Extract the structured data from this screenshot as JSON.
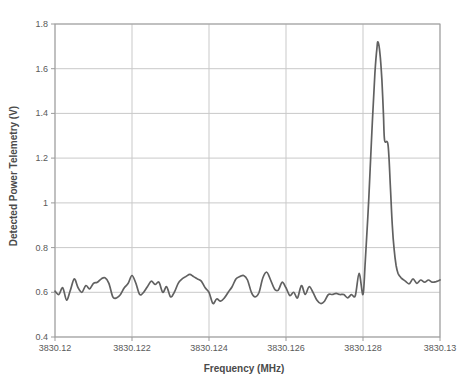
{
  "chart_data": {
    "type": "line",
    "title": "",
    "xlabel": "Frequency (MHz)",
    "ylabel": "Detected Power Telemetry (V)",
    "xlim": [
      3830.12,
      3830.13
    ],
    "ylim": [
      0.4,
      1.8
    ],
    "x_tick_labels": [
      "3830.12",
      "3830.122",
      "3830.124",
      "3830.126",
      "3830.128",
      "3830.13"
    ],
    "x_tick_values": [
      3830.12,
      3830.122,
      3830.124,
      3830.126,
      3830.128,
      3830.13
    ],
    "y_tick_labels": [
      "0.4",
      "0.6",
      "0.8",
      "1",
      "1.2",
      "1.4",
      "1.6",
      "1.8"
    ],
    "y_tick_values": [
      0.4,
      0.6,
      0.8,
      1,
      1.2,
      1.4,
      1.6,
      1.8
    ],
    "grid": true,
    "legend_position": "none",
    "colors": {
      "line": "#616161",
      "grid": "#c9c9c9",
      "axis_border": "#9b9b9b",
      "tick_text": "#595959"
    },
    "series": [
      {
        "name": "Detected Power Telemetry",
        "points": [
          [
            3830.12,
            0.605
          ],
          [
            3830.1201,
            0.59
          ],
          [
            3830.1202,
            0.62
          ],
          [
            3830.1203,
            0.565
          ],
          [
            3830.1204,
            0.61
          ],
          [
            3830.1205,
            0.66
          ],
          [
            3830.1206,
            0.62
          ],
          [
            3830.1207,
            0.6
          ],
          [
            3830.1208,
            0.63
          ],
          [
            3830.1209,
            0.615
          ],
          [
            3830.121,
            0.64
          ],
          [
            3830.1211,
            0.645
          ],
          [
            3830.1212,
            0.66
          ],
          [
            3830.1213,
            0.665
          ],
          [
            3830.1214,
            0.64
          ],
          [
            3830.1215,
            0.58
          ],
          [
            3830.1216,
            0.575
          ],
          [
            3830.1217,
            0.59
          ],
          [
            3830.1218,
            0.62
          ],
          [
            3830.1219,
            0.64
          ],
          [
            3830.122,
            0.675
          ],
          [
            3830.1221,
            0.64
          ],
          [
            3830.1222,
            0.59
          ],
          [
            3830.1223,
            0.6
          ],
          [
            3830.1224,
            0.625
          ],
          [
            3830.1225,
            0.65
          ],
          [
            3830.1226,
            0.635
          ],
          [
            3830.1227,
            0.645
          ],
          [
            3830.1228,
            0.6
          ],
          [
            3830.1229,
            0.625
          ],
          [
            3830.123,
            0.58
          ],
          [
            3830.1231,
            0.6
          ],
          [
            3830.1232,
            0.64
          ],
          [
            3830.1233,
            0.66
          ],
          [
            3830.1234,
            0.67
          ],
          [
            3830.1235,
            0.68
          ],
          [
            3830.1236,
            0.67
          ],
          [
            3830.1237,
            0.66
          ],
          [
            3830.1238,
            0.65
          ],
          [
            3830.1239,
            0.62
          ],
          [
            3830.124,
            0.6
          ],
          [
            3830.1241,
            0.55
          ],
          [
            3830.1242,
            0.57
          ],
          [
            3830.1243,
            0.56
          ],
          [
            3830.1244,
            0.575
          ],
          [
            3830.1245,
            0.6
          ],
          [
            3830.1246,
            0.625
          ],
          [
            3830.1247,
            0.66
          ],
          [
            3830.1248,
            0.67
          ],
          [
            3830.1249,
            0.675
          ],
          [
            3830.125,
            0.655
          ],
          [
            3830.1251,
            0.6
          ],
          [
            3830.1252,
            0.58
          ],
          [
            3830.1253,
            0.6
          ],
          [
            3830.1254,
            0.665
          ],
          [
            3830.1255,
            0.69
          ],
          [
            3830.1256,
            0.655
          ],
          [
            3830.1257,
            0.615
          ],
          [
            3830.1258,
            0.61
          ],
          [
            3830.1259,
            0.645
          ],
          [
            3830.126,
            0.62
          ],
          [
            3830.1261,
            0.585
          ],
          [
            3830.1262,
            0.6
          ],
          [
            3830.1263,
            0.575
          ],
          [
            3830.1264,
            0.63
          ],
          [
            3830.1265,
            0.59
          ],
          [
            3830.1266,
            0.625
          ],
          [
            3830.1267,
            0.6
          ],
          [
            3830.1268,
            0.565
          ],
          [
            3830.1269,
            0.55
          ],
          [
            3830.127,
            0.56
          ],
          [
            3830.1271,
            0.59
          ],
          [
            3830.1272,
            0.59
          ],
          [
            3830.1273,
            0.595
          ],
          [
            3830.1274,
            0.59
          ],
          [
            3830.1275,
            0.59
          ],
          [
            3830.1276,
            0.575
          ],
          [
            3830.1277,
            0.59
          ],
          [
            3830.1278,
            0.585
          ],
          [
            3830.1279,
            0.685
          ],
          [
            3830.128,
            0.59
          ],
          [
            3830.12806,
            0.74
          ],
          [
            3830.12815,
            1.02
          ],
          [
            3830.12823,
            1.32
          ],
          [
            3830.12831,
            1.58
          ],
          [
            3830.12836,
            1.69
          ],
          [
            3830.12839,
            1.72
          ],
          [
            3830.12844,
            1.67
          ],
          [
            3830.12849,
            1.55
          ],
          [
            3830.12853,
            1.4
          ],
          [
            3830.12856,
            1.28
          ],
          [
            3830.12865,
            1.26
          ],
          [
            3830.12871,
            1.08
          ],
          [
            3830.12876,
            0.9
          ],
          [
            3830.12881,
            0.79
          ],
          [
            3830.12886,
            0.72
          ],
          [
            3830.12891,
            0.685
          ],
          [
            3830.12899,
            0.665
          ],
          [
            3830.1291,
            0.65
          ],
          [
            3830.1292,
            0.638
          ],
          [
            3830.1293,
            0.66
          ],
          [
            3830.1294,
            0.64
          ],
          [
            3830.1295,
            0.655
          ],
          [
            3830.1296,
            0.645
          ],
          [
            3830.1297,
            0.655
          ],
          [
            3830.1298,
            0.645
          ],
          [
            3830.1299,
            0.648
          ],
          [
            3830.13,
            0.655
          ]
        ]
      }
    ]
  }
}
